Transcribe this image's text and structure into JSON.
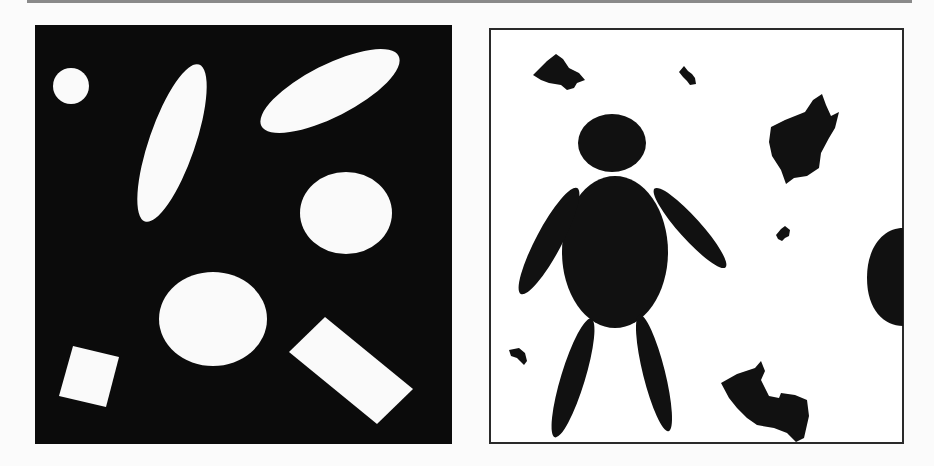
{
  "figure": {
    "panels": [
      {
        "id": "left",
        "description": "Binary image: white geometric shapes on black background",
        "background": "#0b0b0b",
        "foreground": "#fafafa",
        "shapes": [
          {
            "type": "circle",
            "cx": 35,
            "cy": 60,
            "r": 17
          },
          {
            "type": "ellipse",
            "cx": 136,
            "cy": 117,
            "rx": 22,
            "ry": 83,
            "rotate": 18
          },
          {
            "type": "ellipse",
            "cx": 295,
            "cy": 65,
            "rx": 77,
            "ry": 26,
            "rotate": -27
          },
          {
            "type": "ellipse",
            "cx": 311,
            "cy": 187,
            "rx": 46,
            "ry": 41,
            "rotate": 0
          },
          {
            "type": "ellipse",
            "cx": 177,
            "cy": 293,
            "rx": 54,
            "ry": 47,
            "rotate": 0
          },
          {
            "type": "polygon",
            "points": "24,373 37,322 82,332 72,383"
          },
          {
            "type": "polygon",
            "points": "253,329 289,293 377,366 341,401"
          }
        ]
      },
      {
        "id": "right",
        "description": "Binary image: black silhouette blobs on white background",
        "background": "#ffffff",
        "foreground": "#111111",
        "border": "#2a2a2a"
      }
    ]
  }
}
